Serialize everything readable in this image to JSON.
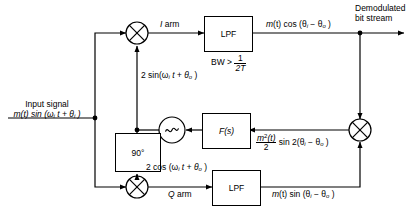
{
  "diagram": {
    "line_color": "#000000",
    "background": "#ffffff",
    "blocks": [
      {
        "id": "lpf_i",
        "label": "LPF",
        "note": "BW > 1/2T"
      },
      {
        "id": "lpf_q",
        "label": "LPF",
        "note": ""
      },
      {
        "id": "fs",
        "label": "F(s)",
        "note": ""
      },
      {
        "id": "phase",
        "label": "90°",
        "note": ""
      },
      {
        "id": "vco",
        "label": "vco-sine-symbol",
        "note": ""
      }
    ],
    "mixers": [
      {
        "id": "mixer_i",
        "name": "i-arm-mixer"
      },
      {
        "id": "mixer_q",
        "name": "q-arm-mixer"
      },
      {
        "id": "mixer_loop",
        "name": "loop-phase-detector-mixer"
      }
    ],
    "labels": {
      "input_title": "Input signal",
      "input_expr_pre": "m",
      "input_expr": "(t)  sin  (ω",
      "input_sub_i": "i",
      "input_expr_mid": " t + θ",
      "input_sub_i2": "i",
      "input_expr_end": " )",
      "i_arm": "I",
      "i_arm_word": "arm",
      "q_arm": "Q",
      "q_arm_word": "arm",
      "carrier_i": "2 sin(ω",
      "carrier_i_sub": "i",
      "carrier_i_mid": " t + θ",
      "carrier_i_sub2": "o",
      "carrier_i_end": " )",
      "carrier_q": "2 cos  (ω",
      "carrier_q_sub": "i",
      "carrier_q_mid": " t + θ",
      "carrier_q_sub2": "o",
      "carrier_q_end": " )",
      "i_out_pre": "m",
      "i_out": "(t)  cos  (θ",
      "i_out_sub1": "i",
      "i_out_mid": " − θ",
      "i_out_sub2": "o",
      "i_out_end": " )",
      "q_out_pre": "m",
      "q_out": "(t)  sin  (θ",
      "q_out_sub1": "i",
      "q_out_mid": " − θ",
      "q_out_sub2": "o",
      "q_out_end": " )",
      "error_num_m": "m",
      "error_num_sup": "2",
      "error_num_t": "(t)",
      "error_den": "2",
      "error_rest": "sin 2(θ",
      "error_sub1": "i",
      "error_mid": " − θ",
      "error_sub2": "o",
      "error_end": " )",
      "output_line1": "Demodulated",
      "output_line2": "bit stream",
      "bw_note_pre": "BW >",
      "bw_num": "1",
      "bw_den": "2T",
      "lpf_label": "LPF",
      "fs_label": "F(s)",
      "phase_label": "90°"
    }
  }
}
